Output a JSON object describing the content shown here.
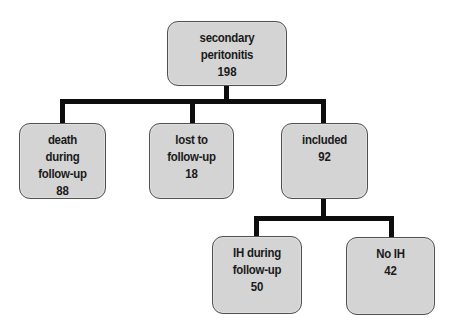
{
  "diagram": {
    "type": "flowchart-tree",
    "root": {
      "label": "secondary peritonitis",
      "count": "198"
    },
    "level1": [
      {
        "label": "death during follow-up",
        "count": "88"
      },
      {
        "label": "lost to follow-up",
        "count": "18"
      },
      {
        "label": "included",
        "count": "92"
      }
    ],
    "level2": [
      {
        "label": "IH during follow-up",
        "count": "50"
      },
      {
        "label": "No IH",
        "count": "42"
      }
    ],
    "edges": [
      {
        "from": "secondary peritonitis",
        "to": "death during follow-up"
      },
      {
        "from": "secondary peritonitis",
        "to": "lost to follow-up"
      },
      {
        "from": "secondary peritonitis",
        "to": "included"
      },
      {
        "from": "included",
        "to": "IH during follow-up"
      },
      {
        "from": "included",
        "to": "No IH"
      }
    ],
    "colors": {
      "node_fill": "#d4d4d4",
      "node_border": "#505050",
      "connector": "#0d0d0d",
      "text": "#1a1a1a"
    }
  }
}
